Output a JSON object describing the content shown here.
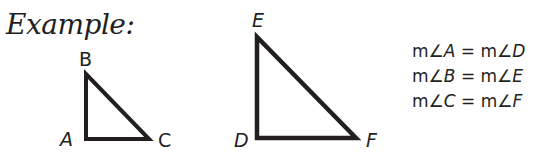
{
  "title": "Example:",
  "triangle_abc": {
    "vertices": {
      "A": "A",
      "B": "B",
      "C": "C"
    }
  },
  "triangle_def": {
    "vertices": {
      "D": "D",
      "E": "E",
      "F": "F"
    }
  },
  "equations": [
    {
      "left_m": "m",
      "angle": "∠",
      "left_v": "A",
      "eq": " = ",
      "right_m": "m",
      "right_v": "D"
    },
    {
      "left_m": "m",
      "angle": "∠",
      "left_v": "B",
      "eq": " = ",
      "right_m": "m",
      "right_v": "E"
    },
    {
      "left_m": "m",
      "angle": "∠",
      "left_v": "C",
      "eq": " = ",
      "right_m": "m",
      "right_v": "F"
    }
  ],
  "colors": {
    "ink": "#231f20",
    "background": "#ffffff"
  }
}
